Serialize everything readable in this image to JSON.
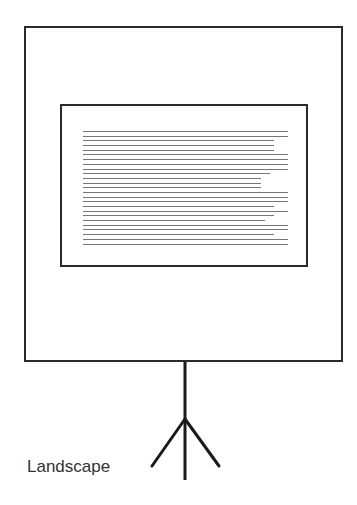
{
  "diagram": {
    "caption": "Landscape",
    "orientation": "landscape",
    "elements": {
      "outer_frame": {
        "shape": "rectangle",
        "description": "projection screen"
      },
      "inner_frame": {
        "shape": "rectangle",
        "description": "landscape page"
      },
      "text_lines": {
        "count": 25,
        "widths_pct": [
          100,
          100,
          93,
          93,
          93,
          100,
          100,
          100,
          100,
          91,
          87,
          87,
          87,
          100,
          100,
          100,
          93,
          100,
          93,
          89,
          100,
          100,
          93,
          100,
          100
        ]
      },
      "stand": {
        "type": "tripod"
      }
    },
    "colors": {
      "stroke": "#2a2a2a",
      "text_lines": "#777777",
      "caption": "#333333",
      "background": "#ffffff"
    }
  }
}
